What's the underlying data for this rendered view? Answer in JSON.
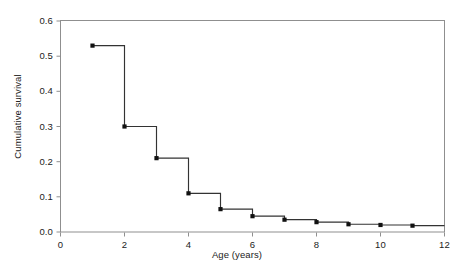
{
  "chart_data": {
    "type": "line",
    "subtype": "step-post survival curve",
    "title": "",
    "xlabel": "Age (years)",
    "ylabel": "Cumulative survival",
    "xlim": [
      0,
      12
    ],
    "ylim": [
      0.0,
      0.6
    ],
    "xticks": [
      0,
      2,
      4,
      6,
      8,
      10,
      12
    ],
    "xtick_labels": [
      "0",
      "2",
      "4",
      "6",
      "8",
      "10",
      "12"
    ],
    "yticks": [
      0.0,
      0.1,
      0.2,
      0.3,
      0.4,
      0.5,
      0.6
    ],
    "ytick_labels": [
      "0.0",
      "0.1",
      "0.2",
      "0.3",
      "0.4",
      "0.5",
      "0.6"
    ],
    "grid": false,
    "legend": false,
    "frame": "box",
    "x": [
      1,
      2,
      3,
      4,
      5,
      6,
      7,
      8,
      9,
      10,
      11
    ],
    "values": [
      0.53,
      0.3,
      0.21,
      0.11,
      0.065,
      0.045,
      0.035,
      0.028,
      0.022,
      0.02,
      0.018
    ],
    "step_end_x": 12,
    "marker": "filled-square",
    "marker_color": "#111111",
    "line_color": "#333333",
    "axis_color": "#8c8c8c",
    "background": "#ffffff",
    "series": [
      {
        "name": "Cumulative survival",
        "points": [
          {
            "x": 1,
            "y": 0.53
          },
          {
            "x": 2,
            "y": 0.3
          },
          {
            "x": 3,
            "y": 0.21
          },
          {
            "x": 4,
            "y": 0.11
          },
          {
            "x": 5,
            "y": 0.065
          },
          {
            "x": 6,
            "y": 0.045
          },
          {
            "x": 7,
            "y": 0.035
          },
          {
            "x": 8,
            "y": 0.028
          },
          {
            "x": 9,
            "y": 0.022
          },
          {
            "x": 10,
            "y": 0.02
          },
          {
            "x": 11,
            "y": 0.018
          }
        ]
      }
    ]
  },
  "axes": {
    "y_title": "Cumulative survival",
    "x_title": "Age (years)",
    "y_tick_0": "0.0",
    "y_tick_1": "0.1",
    "y_tick_2": "0.2",
    "y_tick_3": "0.3",
    "y_tick_4": "0.4",
    "y_tick_5": "0.5",
    "y_tick_6": "0.6",
    "x_tick_0": "0",
    "x_tick_1": "2",
    "x_tick_2": "4",
    "x_tick_3": "6",
    "x_tick_4": "8",
    "x_tick_5": "10",
    "x_tick_6": "12"
  }
}
